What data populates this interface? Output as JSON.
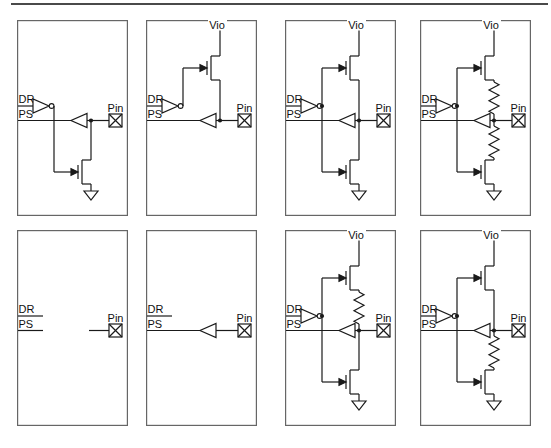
{
  "figure": {
    "background": "#ffffff",
    "rule_color": "#4a4a4a",
    "line_color": "#1a1a1a",
    "border_color": "#666666",
    "text_color": "#111111"
  },
  "labels": {
    "dr": "DR",
    "ps": "PS",
    "pin": "Pin",
    "vio": "Vio"
  },
  "panels": [
    {
      "id": "open-drain-output",
      "vio": false,
      "pmos": false,
      "nmos": true,
      "r_top": false,
      "r_bot": false,
      "inverter": true,
      "buffer": true
    },
    {
      "id": "open-source-output",
      "vio": true,
      "pmos": true,
      "nmos": false,
      "r_top": false,
      "r_bot": false,
      "inverter": true,
      "buffer": true
    },
    {
      "id": "push-pull-output",
      "vio": true,
      "pmos": true,
      "nmos": true,
      "r_top": false,
      "r_bot": false,
      "inverter": true,
      "buffer": true
    },
    {
      "id": "push-pull-series-resistors",
      "vio": true,
      "pmos": true,
      "nmos": true,
      "r_top": true,
      "r_bot": true,
      "inverter": true,
      "buffer": true
    },
    {
      "id": "disconnected",
      "vio": false,
      "pmos": false,
      "nmos": false,
      "r_top": false,
      "r_bot": false,
      "inverter": false,
      "buffer": false
    },
    {
      "id": "input-only",
      "vio": false,
      "pmos": false,
      "nmos": false,
      "r_top": false,
      "r_bot": false,
      "inverter": false,
      "buffer": true
    },
    {
      "id": "push-pull-pullup-resistor",
      "vio": true,
      "pmos": true,
      "nmos": true,
      "r_top": true,
      "r_bot": false,
      "inverter": true,
      "buffer": true
    },
    {
      "id": "push-pull-pulldown-resistor",
      "vio": true,
      "pmos": true,
      "nmos": true,
      "r_top": false,
      "r_bot": true,
      "inverter": true,
      "buffer": true
    }
  ]
}
